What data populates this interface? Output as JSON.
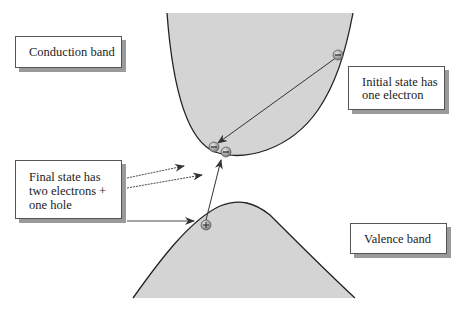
{
  "diagram": {
    "type": "band-structure-impact-ionization",
    "colors": {
      "band_fill": "#d4d4d4",
      "band_edge": "#222222",
      "arrow": "#333333",
      "box_border": "#555555",
      "box_shadow": "#9a9a9a"
    },
    "labels": {
      "conduction_band": "Conduction band",
      "initial_state": [
        "Initial state has",
        "one electron"
      ],
      "final_state": [
        "Final state has",
        "two electrons +",
        "one hole"
      ],
      "valence_band": "Valence band"
    },
    "particles": {
      "initial_electron": {
        "symbol": "−",
        "x": 338,
        "y": 55
      },
      "final_electron_1": {
        "symbol": "−",
        "x": 214,
        "y": 147
      },
      "final_electron_2": {
        "symbol": "−",
        "x": 226,
        "y": 152
      },
      "hole": {
        "symbol": "+",
        "x": 206,
        "y": 225
      }
    }
  }
}
